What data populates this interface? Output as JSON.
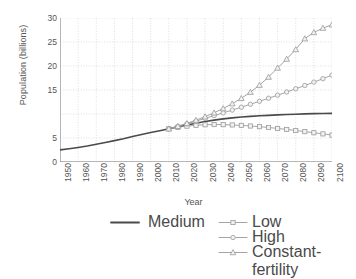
{
  "chart_data": {
    "type": "line",
    "title": "",
    "xlabel": "Year",
    "ylabel": "Population (billions)",
    "xlim": [
      1950,
      2100
    ],
    "ylim": [
      0,
      30
    ],
    "yticks": [
      0,
      5,
      10,
      15,
      20,
      25,
      30
    ],
    "ytick_labels": [
      "0",
      "5",
      "",
      "15",
      "20",
      "25",
      "30"
    ],
    "xticks": [
      1950,
      1960,
      1970,
      1980,
      1990,
      2000,
      2010,
      2020,
      2030,
      2040,
      2050,
      2060,
      2070,
      2080,
      2090,
      2100
    ],
    "xtick_labels": [
      "1950",
      "1960",
      "1970",
      "1980",
      "1990",
      "2000",
      "2010",
      "2020",
      "2030",
      "2040",
      "2050",
      "2060",
      "2070",
      "2080",
      "2090",
      "2100"
    ],
    "grid": true,
    "grid_style": "dotted",
    "legend_position": "bottom",
    "series": [
      {
        "name": "Medium",
        "marker": "none",
        "color": "#4a4a4a",
        "linewidth": 1.6,
        "x": [
          1950,
          1955,
          1960,
          1965,
          1970,
          1975,
          1980,
          1985,
          1990,
          1995,
          2000,
          2005,
          2010,
          2015,
          2020,
          2025,
          2030,
          2035,
          2040,
          2045,
          2050,
          2055,
          2060,
          2065,
          2070,
          2075,
          2080,
          2085,
          2090,
          2095,
          2100
        ],
        "y": [
          2.53,
          2.77,
          3.03,
          3.33,
          3.69,
          4.07,
          4.45,
          4.85,
          5.32,
          5.74,
          6.13,
          6.51,
          6.92,
          7.32,
          7.72,
          8.08,
          8.42,
          8.72,
          8.98,
          9.2,
          9.37,
          9.51,
          9.62,
          9.72,
          9.81,
          9.89,
          9.96,
          10.02,
          10.07,
          10.11,
          10.12
        ],
        "marker_start": 2010
      },
      {
        "name": "Low",
        "marker": "square",
        "color": "#9a9a9a",
        "linewidth": 0.9,
        "x": [
          2010,
          2015,
          2020,
          2025,
          2030,
          2035,
          2040,
          2045,
          2050,
          2055,
          2060,
          2065,
          2070,
          2075,
          2080,
          2085,
          2090,
          2095,
          2100
        ],
        "y": [
          6.92,
          7.22,
          7.47,
          7.65,
          7.76,
          7.8,
          7.78,
          7.72,
          7.62,
          7.5,
          7.36,
          7.19,
          6.99,
          6.78,
          6.56,
          6.33,
          6.1,
          5.86,
          5.61
        ]
      },
      {
        "name": "High",
        "marker": "circle",
        "color": "#9a9a9a",
        "linewidth": 0.9,
        "x": [
          2010,
          2015,
          2020,
          2025,
          2030,
          2035,
          2040,
          2045,
          2050,
          2055,
          2060,
          2065,
          2070,
          2075,
          2080,
          2085,
          2090,
          2095,
          2100
        ],
        "y": [
          6.92,
          7.42,
          7.97,
          8.52,
          9.09,
          9.66,
          10.23,
          10.82,
          11.42,
          12.03,
          12.65,
          13.28,
          13.92,
          14.58,
          15.25,
          15.94,
          16.64,
          17.36,
          18.1
        ]
      },
      {
        "name": "Constant-fertility",
        "marker": "triangle",
        "color": "#9a9a9a",
        "linewidth": 0.9,
        "x": [
          2010,
          2015,
          2020,
          2025,
          2030,
          2035,
          2040,
          2045,
          2050,
          2055,
          2060,
          2065,
          2070,
          2075,
          2080,
          2085,
          2090,
          2095,
          2100
        ],
        "y": [
          6.92,
          7.45,
          8.05,
          8.72,
          9.45,
          10.26,
          11.15,
          12.15,
          13.27,
          14.55,
          16.02,
          17.7,
          19.6,
          21.45,
          23.45,
          25.7,
          27.0,
          27.9,
          28.6
        ]
      }
    ]
  },
  "legend": {
    "items": [
      {
        "label": "Medium",
        "marker": "none",
        "color": "#4a4a4a"
      },
      {
        "label": "Low",
        "marker": "square",
        "color": "#9a9a9a"
      },
      {
        "label": "High",
        "marker": "circle",
        "color": "#9a9a9a"
      },
      {
        "label": "Constant-fertility",
        "marker": "triangle",
        "color": "#9a9a9a"
      }
    ]
  },
  "colors": {
    "axis": "#707070",
    "grid": "#c9c9c9",
    "text": "#555555",
    "medium": "#4a4a4a",
    "projection": "#9a9a9a",
    "background": "#ffffff"
  }
}
